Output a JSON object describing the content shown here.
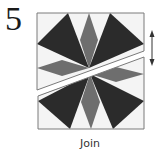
{
  "step": {
    "number": "5",
    "caption": "Join"
  },
  "diagram": {
    "colors": {
      "background": "#ffffff",
      "dark": "#2b2b2b",
      "medium": "#6e6e6e",
      "light": "#f2f2f2",
      "outline": "#7a7a7a",
      "arrow": "#333333"
    },
    "arrow_icon": "double-vertical-arrow"
  }
}
